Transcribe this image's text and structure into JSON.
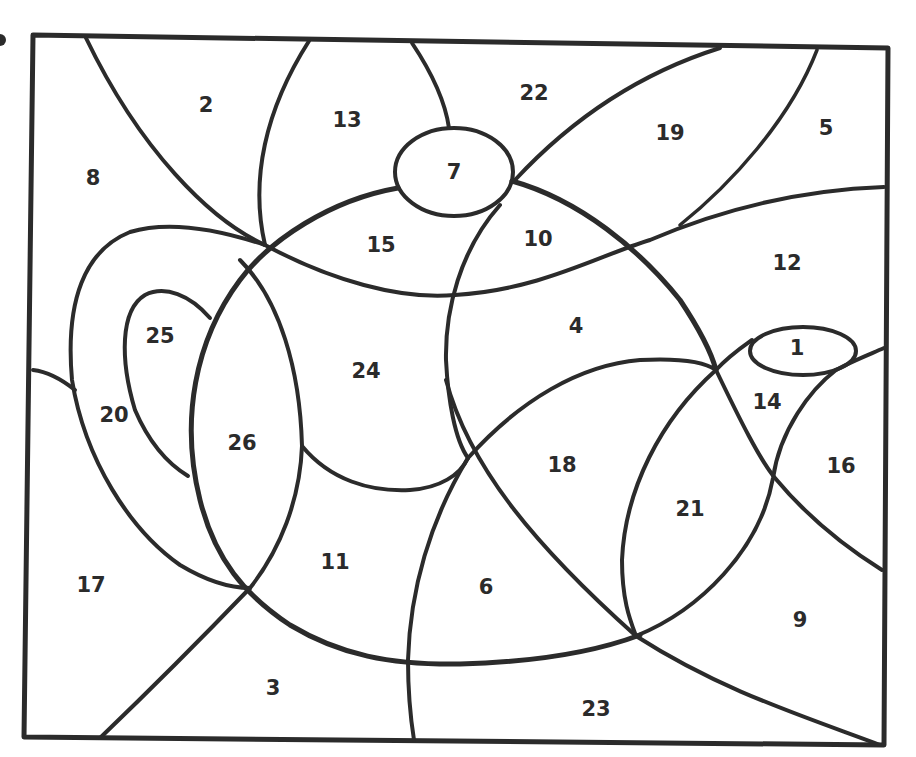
{
  "diagram": {
    "type": "color-by-number puzzle",
    "colors": {
      "line": "#2b2b2b",
      "background": "#ffffff"
    },
    "regions": [
      {
        "label": "1",
        "x": 797,
        "y": 349
      },
      {
        "label": "2",
        "x": 206,
        "y": 106
      },
      {
        "label": "3",
        "x": 273,
        "y": 689
      },
      {
        "label": "4",
        "x": 576,
        "y": 327
      },
      {
        "label": "5",
        "x": 826,
        "y": 129
      },
      {
        "label": "6",
        "x": 486,
        "y": 588
      },
      {
        "label": "7",
        "x": 454,
        "y": 173
      },
      {
        "label": "8",
        "x": 93,
        "y": 179
      },
      {
        "label": "9",
        "x": 800,
        "y": 621
      },
      {
        "label": "10",
        "x": 538,
        "y": 240
      },
      {
        "label": "11",
        "x": 335,
        "y": 563
      },
      {
        "label": "12",
        "x": 787,
        "y": 264
      },
      {
        "label": "13",
        "x": 347,
        "y": 121
      },
      {
        "label": "14",
        "x": 767,
        "y": 403
      },
      {
        "label": "15",
        "x": 381,
        "y": 246
      },
      {
        "label": "16",
        "x": 841,
        "y": 467
      },
      {
        "label": "17",
        "x": 91,
        "y": 586
      },
      {
        "label": "18",
        "x": 562,
        "y": 466
      },
      {
        "label": "19",
        "x": 670,
        "y": 134
      },
      {
        "label": "20",
        "x": 114,
        "y": 416
      },
      {
        "label": "21",
        "x": 690,
        "y": 510
      },
      {
        "label": "22",
        "x": 534,
        "y": 94
      },
      {
        "label": "23",
        "x": 596,
        "y": 710
      },
      {
        "label": "24",
        "x": 366,
        "y": 372
      },
      {
        "label": "25",
        "x": 160,
        "y": 337
      },
      {
        "label": "26",
        "x": 242,
        "y": 444
      }
    ]
  }
}
